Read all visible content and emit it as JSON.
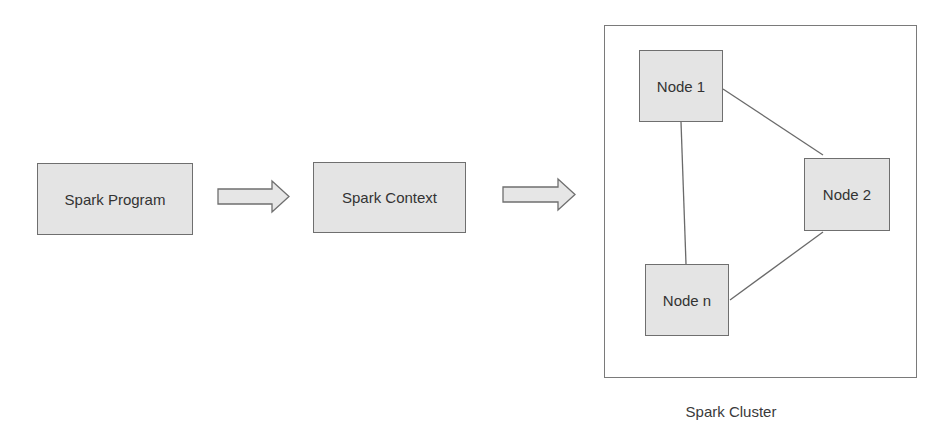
{
  "diagram": {
    "flow": [
      {
        "id": "spark-program",
        "label": "Spark Program"
      },
      {
        "id": "spark-context",
        "label": "Spark Context"
      }
    ],
    "arrows": [
      {
        "from": "spark-program",
        "to": "spark-context"
      },
      {
        "from": "spark-context",
        "to": "spark-cluster"
      }
    ],
    "cluster": {
      "label": "Spark Cluster",
      "nodes": [
        {
          "id": "node-1",
          "label": "Node 1"
        },
        {
          "id": "node-2",
          "label": "Node 2"
        },
        {
          "id": "node-n",
          "label": "Node n"
        }
      ],
      "edges": [
        {
          "from": "node-1",
          "to": "node-n"
        },
        {
          "from": "node-1",
          "to": "node-2"
        },
        {
          "from": "node-2",
          "to": "node-n"
        }
      ]
    },
    "colors": {
      "box_fill": "#e4e4e4",
      "box_border": "#6f6f6f",
      "line": "#6a6a6a",
      "text": "#333333"
    }
  }
}
